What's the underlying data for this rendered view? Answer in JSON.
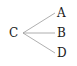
{
  "diagram": {
    "type": "tree",
    "root": {
      "id": "C",
      "label": "C"
    },
    "children": [
      {
        "id": "A",
        "label": "A"
      },
      {
        "id": "B",
        "label": "B"
      },
      {
        "id": "D",
        "label": "D"
      }
    ],
    "edges": [
      [
        "C",
        "A"
      ],
      [
        "C",
        "B"
      ],
      [
        "C",
        "D"
      ]
    ],
    "line_color": "#9a9a9a",
    "text_color": "#1a1a1a"
  }
}
